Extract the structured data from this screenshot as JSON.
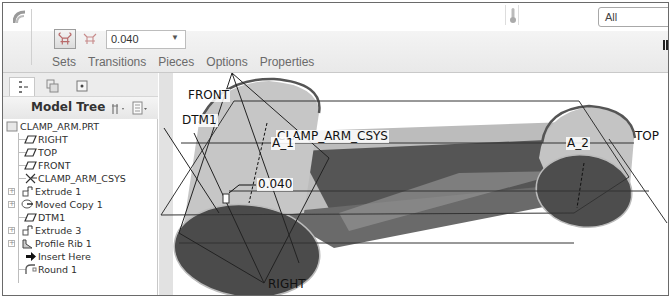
{
  "ribbon": {
    "filter_select": "All",
    "value_select": "0.040",
    "tabs": [
      "Sets",
      "Transitions",
      "Pieces",
      "Options",
      "Properties"
    ]
  },
  "left_panel": {
    "title": "Model Tree",
    "tree": [
      {
        "label": "CLAMP_ARM.PRT",
        "icon": "part-icon",
        "expandable": false
      },
      {
        "label": "RIGHT",
        "icon": "datum-plane-icon",
        "expandable": false
      },
      {
        "label": "TOP",
        "icon": "datum-plane-icon",
        "expandable": false
      },
      {
        "label": "FRONT",
        "icon": "datum-plane-icon",
        "expandable": false
      },
      {
        "label": "CLAMP_ARM_CSYS",
        "icon": "csys-icon",
        "expandable": false
      },
      {
        "label": "Extrude 1",
        "icon": "extrude-icon",
        "expandable": true
      },
      {
        "label": "Moved Copy 1",
        "icon": "moved-copy-icon",
        "expandable": true
      },
      {
        "label": "DTM1",
        "icon": "datum-plane-icon",
        "expandable": false
      },
      {
        "label": "Extrude 3",
        "icon": "extrude-icon",
        "expandable": true
      },
      {
        "label": "Profile Rib 1",
        "icon": "profile-rib-icon",
        "expandable": true
      },
      {
        "label": "Insert Here",
        "icon": "insert-here-arrow-icon",
        "expandable": false
      },
      {
        "label": "Round 1",
        "icon": "round-icon",
        "expandable": false
      }
    ]
  },
  "viewport": {
    "labels": {
      "front": "FRONT",
      "dtm1": "DTM1",
      "csys": "CLAMP_ARM_CSYS",
      "axis1": "A_1",
      "axis2": "A_2",
      "top": "TOP",
      "right": "RIGHT",
      "dimension": "0.040"
    },
    "colors": {
      "body_light": "#bdbdbd",
      "body_dark": "#5c5c5c",
      "face_dark": "#4a4a4a"
    }
  }
}
